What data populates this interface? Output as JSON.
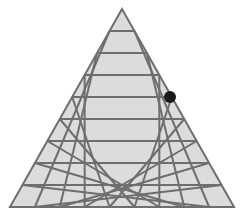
{
  "diagram": {
    "type": "triangular-grid",
    "rows": 9,
    "apex": {
      "x": 122,
      "y": 9
    },
    "base_left": {
      "x": 10,
      "y": 207
    },
    "base_right": {
      "x": 234,
      "y": 207
    },
    "fill_color": "#dcdcdc",
    "line_color": "#6e6e6e",
    "line_width": 2,
    "marker": {
      "row": 4,
      "position": "right-edge",
      "x": 170,
      "y": 97,
      "radius": 6,
      "color": "#1a1a1a"
    }
  }
}
